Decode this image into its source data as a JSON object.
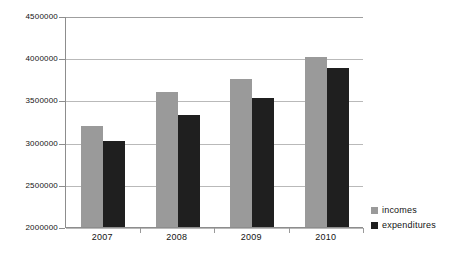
{
  "chart_data": {
    "type": "bar",
    "title": "",
    "subtitle": "",
    "xlabel": "",
    "ylabel": "",
    "categories": [
      "2007",
      "2008",
      "2009",
      "2010"
    ],
    "series": [
      {
        "name": "incomes",
        "color": "#9a9a9a",
        "values": [
          3200000,
          3600000,
          3750000,
          4010000
        ]
      },
      {
        "name": "expenditures",
        "color": "#1f1f1f",
        "values": [
          3020000,
          3330000,
          3530000,
          3880000
        ]
      }
    ],
    "ylim": [
      2000000,
      4500000
    ],
    "ytick_values": [
      2000000,
      2500000,
      3000000,
      3500000,
      4000000,
      4500000
    ],
    "ytick_labels": [
      "2000000",
      "2500000",
      "3000000",
      "3500000",
      "4000000",
      "4500000"
    ],
    "grid": true,
    "grid_axis": "y",
    "legend_position": "right-bottom",
    "legend_entries": [
      "incomes",
      "expenditures"
    ]
  },
  "axes": {
    "line_color": "#8d8d8d",
    "grid_color": "#b9b9b9"
  }
}
